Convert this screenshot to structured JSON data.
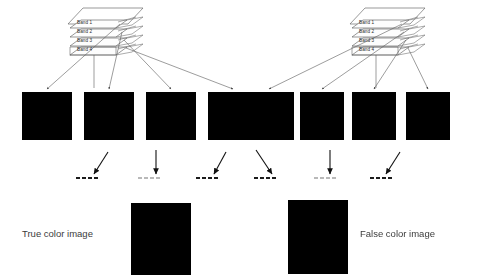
{
  "diagram": {
    "background_color": "#ffffff",
    "line_color": "#5a5a5a",
    "arrow_color": "#111111",
    "groups": [
      {
        "id": "true-color",
        "caption": "True color image",
        "caption_x": 22,
        "caption_y": 228,
        "stack": {
          "x": 70,
          "y": 8,
          "labels": [
            "Band 1",
            "Band 2",
            "Band 3",
            "Band 4"
          ]
        },
        "tiles": [
          {
            "name": "band-1-tile",
            "x": 22,
            "y": 92,
            "w": 50,
            "h": 48,
            "seed": 11,
            "river": "fork",
            "bright": 0.78,
            "contrast": 1.05
          },
          {
            "name": "band-2-tile",
            "x": 84,
            "y": 92,
            "w": 50,
            "h": 48,
            "seed": 23,
            "river": "wide",
            "bright": 0.92,
            "contrast": 1.25
          },
          {
            "name": "band-3-tile",
            "x": 146,
            "y": 92,
            "w": 50,
            "h": 48,
            "seed": 37,
            "river": "thin",
            "bright": 0.95,
            "contrast": 1.3
          },
          {
            "name": "band-4-tile",
            "x": 208,
            "y": 92,
            "w": 50,
            "h": 48,
            "seed": 51,
            "river": "thin",
            "bright": 0.9,
            "contrast": 1.2
          }
        ],
        "channel_bars": [
          {
            "name": "red-channel-bar",
            "x": 76,
            "y": 177,
            "dashes": 4,
            "faint": false
          },
          {
            "name": "green-channel-bar",
            "x": 138,
            "y": 177,
            "dashes": 4,
            "faint": true
          },
          {
            "name": "blue-channel-bar",
            "x": 196,
            "y": 177,
            "dashes": 4,
            "faint": false
          }
        ],
        "arrows": [
          {
            "name": "band-to-red-arrow",
            "x1": 108,
            "y1": 152,
            "x2": 94,
            "y2": 174
          },
          {
            "name": "band-to-green-arrow",
            "x1": 156,
            "y1": 150,
            "x2": 156,
            "y2": 174
          },
          {
            "name": "band-to-blue-arrow",
            "x1": 226,
            "y1": 152,
            "x2": 214,
            "y2": 174
          }
        ],
        "composite": {
          "name": "true-color-composite",
          "x": 131,
          "y": 203,
          "w": 60,
          "h": 72,
          "seed": 77
        }
      },
      {
        "id": "false-color",
        "caption": "False color image",
        "caption_x": 360,
        "caption_y": 228,
        "stack": {
          "x": 352,
          "y": 8,
          "labels": [
            "Band 1",
            "Band 2",
            "Band 3",
            "Band 4"
          ]
        },
        "tiles": [
          {
            "name": "band-1-tile",
            "x": 244,
            "y": 92,
            "w": 50,
            "h": 48,
            "seed": 11,
            "river": "fork",
            "bright": 0.78,
            "contrast": 1.05
          },
          {
            "name": "band-2-tile",
            "x": 300,
            "y": 92,
            "w": 44,
            "h": 48,
            "seed": 23,
            "river": "wide",
            "bright": 0.92,
            "contrast": 1.25
          },
          {
            "name": "band-3-tile",
            "x": 352,
            "y": 92,
            "w": 44,
            "h": 48,
            "seed": 37,
            "river": "thin",
            "bright": 0.95,
            "contrast": 1.3
          },
          {
            "name": "band-4-tile",
            "x": 406,
            "y": 92,
            "w": 44,
            "h": 48,
            "seed": 51,
            "river": "thin",
            "bright": 0.9,
            "contrast": 1.2
          }
        ],
        "channel_bars": [
          {
            "name": "red-channel-bar",
            "x": 254,
            "y": 177,
            "dashes": 4,
            "faint": false
          },
          {
            "name": "green-channel-bar",
            "x": 314,
            "y": 177,
            "dashes": 4,
            "faint": true
          },
          {
            "name": "blue-channel-bar",
            "x": 370,
            "y": 177,
            "dashes": 4,
            "faint": false
          }
        ],
        "arrows": [
          {
            "name": "band-to-red-arrow",
            "x1": 256,
            "y1": 150,
            "x2": 272,
            "y2": 174
          },
          {
            "name": "band-to-green-arrow",
            "x1": 330,
            "y1": 150,
            "x2": 330,
            "y2": 174
          },
          {
            "name": "band-to-blue-arrow",
            "x1": 400,
            "y1": 152,
            "x2": 386,
            "y2": 174
          }
        ],
        "composite": {
          "name": "false-color-composite",
          "x": 288,
          "y": 200,
          "w": 60,
          "h": 74,
          "seed": 93
        }
      }
    ]
  }
}
